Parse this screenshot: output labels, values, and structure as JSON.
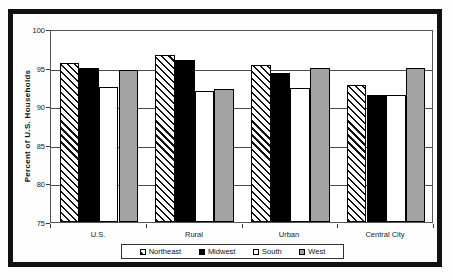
{
  "chart_data": {
    "type": "bar",
    "title": "",
    "xlabel": "",
    "ylabel": "Percent of U.S. Households",
    "ylim": [
      75,
      100
    ],
    "yticks": [
      75,
      80,
      85,
      90,
      95,
      100
    ],
    "grid": true,
    "legend_position": "bottom-center",
    "categories": [
      "U.S.",
      "Rural",
      "Urban",
      "Central City"
    ],
    "series": [
      {
        "name": "Northeast",
        "pattern": "diagonal-hatch",
        "values": [
          95.6,
          96.7,
          95.3,
          92.7
        ]
      },
      {
        "name": "Midwest",
        "pattern": "solid-black",
        "values": [
          95.0,
          96.0,
          94.3,
          91.5
        ]
      },
      {
        "name": "South",
        "pattern": "solid-white",
        "values": [
          92.5,
          92.0,
          92.3,
          91.4
        ]
      },
      {
        "name": "West",
        "pattern": "solid-gray",
        "values": [
          94.7,
          92.2,
          95.0,
          95.0
        ]
      }
    ]
  },
  "colors": {
    "bar_gray": "#a3a3a3",
    "bar_black": "#000000",
    "bar_white": "#ffffff",
    "frame_border": "#111111",
    "gridline": "#4a4a4a",
    "background": "#ffffff"
  }
}
